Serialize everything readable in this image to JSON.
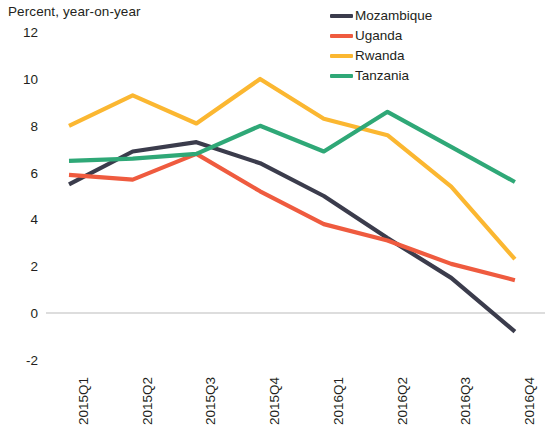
{
  "chart_data": {
    "type": "line",
    "title": "",
    "ylabel": "Percent, year-on-year",
    "xlabel": "",
    "categories": [
      "2015Q1",
      "2015Q2",
      "2015Q3",
      "2015Q4",
      "2016Q1",
      "2016Q2",
      "2016Q3",
      "2016Q4"
    ],
    "yticks": [
      12,
      10,
      8,
      6,
      4,
      2,
      0,
      -2
    ],
    "ylim": [
      -2,
      12
    ],
    "grid": false,
    "zero_line": true,
    "legend_position": "top-right",
    "series": [
      {
        "name": "Mozambique",
        "color": "#3b3c4c",
        "values": [
          5.5,
          6.9,
          7.3,
          6.4,
          5.0,
          3.2,
          1.5,
          -0.8
        ]
      },
      {
        "name": "Uganda",
        "color": "#ef5b3f",
        "values": [
          5.9,
          5.7,
          6.8,
          5.2,
          3.8,
          3.1,
          2.1,
          1.4
        ]
      },
      {
        "name": "Rwanda",
        "color": "#fbb731",
        "values": [
          8.0,
          9.3,
          8.1,
          10.0,
          8.3,
          7.6,
          5.4,
          2.3
        ]
      },
      {
        "name": "Tanzania",
        "color": "#2fa877",
        "values": [
          6.5,
          6.6,
          6.8,
          8.0,
          6.9,
          8.6,
          7.1,
          5.6
        ]
      }
    ]
  },
  "axis": {
    "ylabel_text": "Percent, year-on-year"
  }
}
